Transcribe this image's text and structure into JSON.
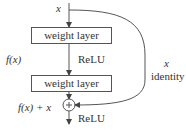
{
  "diagram": {
    "input_label": "x",
    "layers": [
      {
        "label": "weight layer"
      },
      {
        "label": "weight layer"
      }
    ],
    "activation_1": "ReLU",
    "activation_2": "ReLU",
    "fx_label": "f(x)",
    "sum_label": "f(x) + x",
    "skip_label_var": "x",
    "skip_label": "identity",
    "add_symbol": "+",
    "colors": {
      "stroke": "#555555",
      "text": "#333333",
      "background": "#ffffff"
    }
  }
}
